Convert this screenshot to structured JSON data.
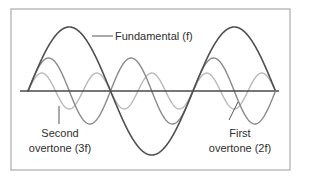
{
  "diagram": {
    "type": "harmonic waveforms",
    "frame": {
      "x": 11,
      "y": 9,
      "width": 279,
      "height": 161,
      "stroke": "#9a9a9a"
    },
    "axis": {
      "x1": 20,
      "x2": 279,
      "y": 91,
      "stroke": "#4a4a4a"
    },
    "waves": [
      {
        "id": "fundamental",
        "name": "Fundamental (f)",
        "harmonic": 1,
        "x_start": 28,
        "x_end": 275,
        "baseline_y": 91,
        "amplitude": 64,
        "period": 165,
        "color": "#4f4f4f",
        "width": 1.6
      },
      {
        "id": "first-overtone",
        "name": "First overtone (2f)",
        "harmonic": 2,
        "x_start": 28,
        "x_end": 275,
        "baseline_y": 91,
        "amplitude": 33,
        "period": 82.5,
        "color": "#8a8a8a",
        "width": 1.4
      },
      {
        "id": "second-overtone",
        "name": "Second overtone (3f)",
        "harmonic": 3,
        "x_start": 28,
        "x_end": 275,
        "baseline_y": 91,
        "amplitude": 18,
        "period": 55,
        "color": "#b9b9b9",
        "width": 1.4
      }
    ],
    "labels": {
      "fundamental": {
        "text": "Fundamental (f)"
      },
      "second_overtone": {
        "line1": "Second",
        "line2": "overtone (3f)"
      },
      "first_overtone": {
        "line1": "First",
        "line2": "overtone (2f)"
      }
    },
    "leaders": {
      "fundamental": {
        "x1": 92,
        "y1": 36,
        "x2": 113,
        "y2": 36
      },
      "second_overtone": {
        "x1": 59,
        "y1": 106,
        "x2": 59,
        "y2": 124
      },
      "first_overtone": {
        "x1": 238,
        "y1": 102,
        "x2": 229,
        "y2": 120
      }
    },
    "text_color": "#2e2e2e",
    "leader_color": "#555555"
  }
}
